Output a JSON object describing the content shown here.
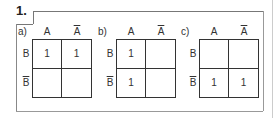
{
  "problem_number": "1.",
  "maps": [
    {
      "label": "a)",
      "col_headers": [
        "A",
        "A"
      ],
      "col_overline": [
        false,
        true
      ],
      "row_headers": [
        "B",
        "B"
      ],
      "row_overline": [
        false,
        true
      ],
      "cells": [
        [
          "1",
          "1"
        ],
        [
          "",
          ""
        ]
      ]
    },
    {
      "label": "b)",
      "col_headers": [
        "A",
        "A"
      ],
      "col_overline": [
        false,
        true
      ],
      "row_headers": [
        "B",
        "B"
      ],
      "row_overline": [
        false,
        true
      ],
      "cells": [
        [
          "1",
          ""
        ],
        [
          "1",
          ""
        ]
      ]
    },
    {
      "label": "c)",
      "col_headers": [
        "A",
        "A"
      ],
      "col_overline": [
        false,
        true
      ],
      "row_headers": [
        "B",
        "B"
      ],
      "row_overline": [
        false,
        true
      ],
      "cells": [
        [
          "",
          ""
        ],
        [
          "1",
          "1"
        ]
      ]
    }
  ]
}
